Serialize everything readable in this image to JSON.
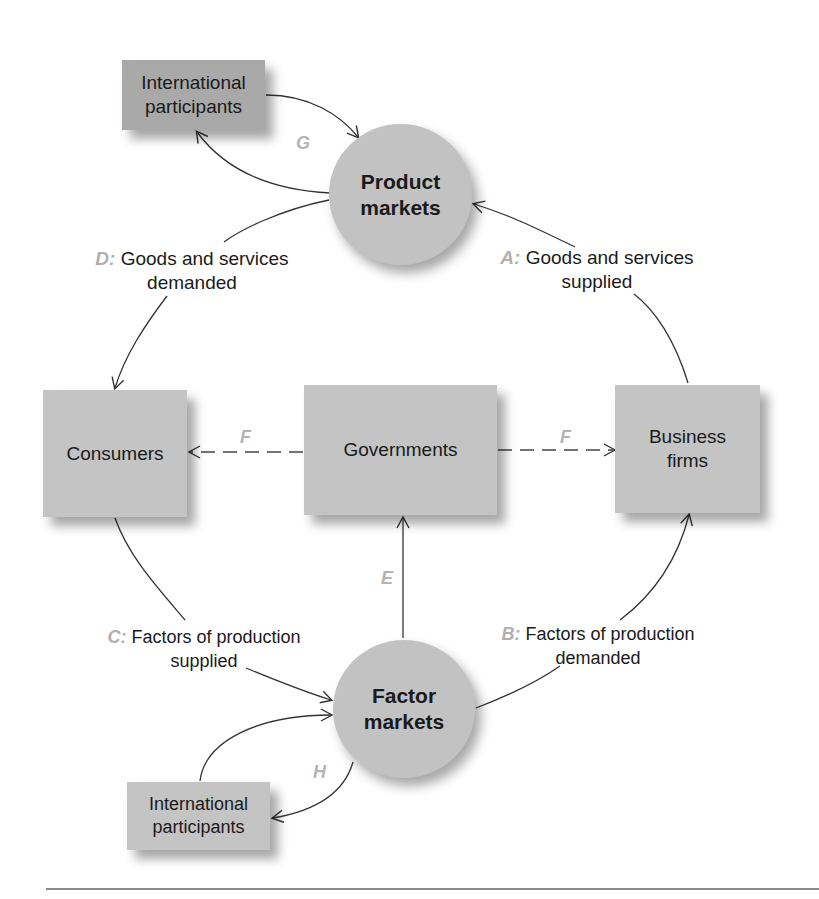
{
  "diagram": {
    "type": "circular-flow",
    "nodes": {
      "intl_top": {
        "label_line1": "International",
        "label_line2": "participants"
      },
      "product_markets": {
        "label_line1": "Product",
        "label_line2": "markets"
      },
      "consumers": {
        "label": "Consumers"
      },
      "governments": {
        "label": "Governments"
      },
      "business_firms": {
        "label_line1": "Business",
        "label_line2": "firms"
      },
      "factor_markets": {
        "label_line1": "Factor",
        "label_line2": "markets"
      },
      "intl_bottom": {
        "label_line1": "International",
        "label_line2": "participants"
      }
    },
    "flows": {
      "A": {
        "letter": "A:",
        "line1": "Goods and services",
        "line2": "supplied"
      },
      "B": {
        "letter": "B:",
        "line1": "Factors of production",
        "line2": "demanded"
      },
      "C": {
        "letter": "C:",
        "line1": "Factors of production",
        "line2": "supplied"
      },
      "D": {
        "letter": "D:",
        "line1": "Goods and services",
        "line2": "demanded"
      },
      "E": {
        "letter": "E"
      },
      "F_left": {
        "letter": "F"
      },
      "F_right": {
        "letter": "F"
      },
      "G": {
        "letter": "G"
      },
      "H": {
        "letter": "H"
      }
    },
    "colors": {
      "box_fill": "#c4c4c4",
      "box_fill_dark": "#a9a9a9",
      "circle_fill": "#c2c2c2",
      "letter_color": "#b0b0b0",
      "line_color": "#333333"
    }
  }
}
